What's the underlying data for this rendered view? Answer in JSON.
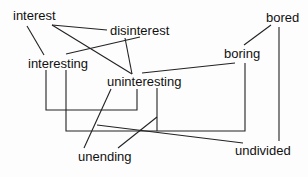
{
  "diagram": {
    "words": [
      {
        "id": "interest",
        "label": "interest",
        "x": 13,
        "y": 10
      },
      {
        "id": "disinterest",
        "label": "disinterest",
        "x": 110,
        "y": 24
      },
      {
        "id": "interesting",
        "label": "interesting",
        "x": 28,
        "y": 57
      },
      {
        "id": "uninteresting",
        "label": "uninteresting",
        "x": 107,
        "y": 75
      },
      {
        "id": "bored",
        "label": "bored",
        "x": 266,
        "y": 12
      },
      {
        "id": "boring",
        "label": "boring",
        "x": 224,
        "y": 47
      },
      {
        "id": "unending",
        "label": "unending",
        "x": 78,
        "y": 150
      },
      {
        "id": "undivided",
        "label": "undivided",
        "x": 235,
        "y": 144
      }
    ],
    "line_color": "#222222",
    "edges": [
      {
        "from": "interest",
        "to": "interesting"
      },
      {
        "from": "interest",
        "to": "disinterest"
      },
      {
        "from": "interest",
        "to": "uninteresting"
      },
      {
        "from": "disinterest",
        "to": "interesting"
      },
      {
        "from": "disinterest",
        "to": "uninteresting"
      },
      {
        "from": "uninteresting",
        "to": "boring"
      },
      {
        "from": "bored",
        "to": "boring"
      },
      {
        "from": "bored",
        "to": "undivided"
      },
      {
        "from": "interesting",
        "to": "uninteresting",
        "style": "bracket"
      },
      {
        "from": "interesting",
        "to": "boring",
        "style": "bracket"
      },
      {
        "from": "uninteresting",
        "to": "unending"
      },
      {
        "from": "uninteresting",
        "to": "unending",
        "style": "via-bracket"
      },
      {
        "from": "interesting",
        "to": "undivided",
        "style": "via-bracket"
      }
    ]
  }
}
